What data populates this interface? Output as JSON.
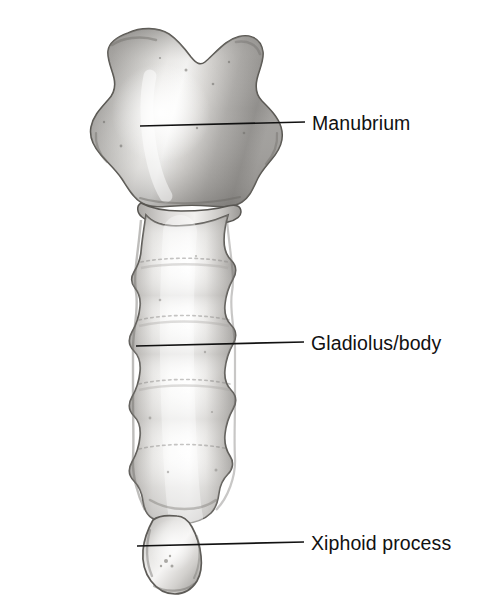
{
  "figure": {
    "kind": "anatomical-illustration",
    "view": "anterior",
    "style": "grayscale photograph with line leaders",
    "background_color": "#ffffff",
    "leader_color": "#111111",
    "text_color": "#111111",
    "width": 497,
    "height": 616
  },
  "labels": [
    {
      "id": "manubrium",
      "text": "Manubrium",
      "text_x": 312,
      "text_y": 114,
      "leader_from_x": 140,
      "leader_from_y": 126,
      "leader_to_x": 305,
      "leader_to_y": 122
    },
    {
      "id": "gladiolus",
      "text": "Gladiolus/body",
      "text_x": 311,
      "text_y": 334,
      "leader_from_x": 136,
      "leader_from_y": 346,
      "leader_to_x": 304,
      "leader_to_y": 342
    },
    {
      "id": "xiphoid",
      "text": "Xiphoid process",
      "text_x": 311,
      "text_y": 534,
      "leader_from_x": 137,
      "leader_from_y": 546,
      "leader_to_x": 304,
      "leader_to_y": 542
    }
  ],
  "bone_parts": [
    {
      "id": "manubrium",
      "name": "Manubrium",
      "region": "upper broad plate with jugular notch"
    },
    {
      "id": "gladiolus",
      "name": "Gladiolus/body",
      "region": "long central shaft with costal notches"
    },
    {
      "id": "xiphoid",
      "name": "Xiphoid process",
      "region": "small rounded inferior nub"
    }
  ],
  "tones": {
    "bone_light": "#f4f3f1",
    "bone_mid": "#c9c7c4",
    "bone_dark": "#8d8b88",
    "outline": "#5c5a57",
    "highlight": "#ffffff"
  }
}
